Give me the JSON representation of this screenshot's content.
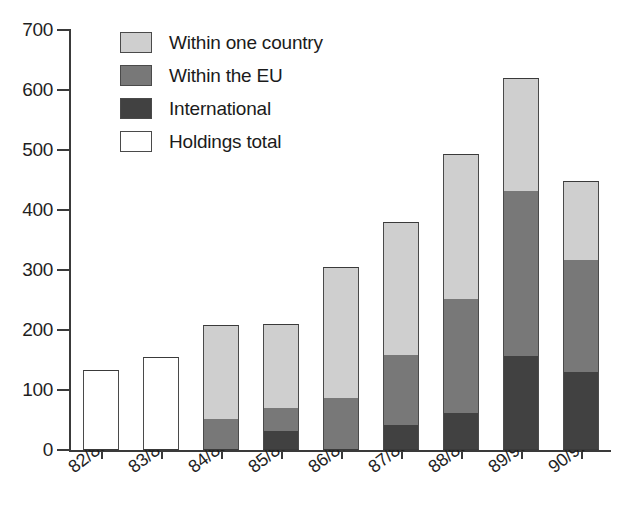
{
  "chart_data": {
    "type": "bar",
    "subtype": "stacked-bar",
    "title": "",
    "xlabel": "",
    "ylabel": "",
    "ylim": [
      0,
      700
    ],
    "yticks": [
      0,
      100,
      200,
      300,
      400,
      500,
      600,
      700
    ],
    "ytick_labels": [
      "0",
      "100",
      "200",
      "300",
      "400",
      "500",
      "600",
      "700"
    ],
    "grid": false,
    "legend_position": "top-left",
    "categories": [
      "82/83",
      "83/84",
      "84/85",
      "85/86",
      "86/87",
      "87/88",
      "88/89",
      "89/90",
      "90/91"
    ],
    "series": [
      {
        "name": "Within one country",
        "color": "#cfcfcf",
        "values": [
          null,
          null,
          156,
          140,
          218,
          222,
          242,
          189,
          131
        ]
      },
      {
        "name": "Within the EU",
        "color": "#787878",
        "values": [
          null,
          null,
          52,
          38,
          87,
          116,
          190,
          275,
          187
        ]
      },
      {
        "name": "International",
        "color": "#414141",
        "values": [
          null,
          null,
          0,
          32,
          0,
          42,
          61,
          156,
          130
        ]
      },
      {
        "name": "Holdings total",
        "color": "#ffffff",
        "values": [
          133,
          155,
          null,
          null,
          null,
          null,
          null,
          null,
          null
        ]
      }
    ],
    "totals": [
      133,
      155,
      208,
      210,
      305,
      380,
      493,
      620,
      448
    ],
    "annotations": []
  },
  "legend": {
    "items": [
      {
        "label": "Within one country",
        "swatch": "light-gray",
        "color": "#cfcfcf"
      },
      {
        "label": "Within the EU",
        "swatch": "medium-gray",
        "color": "#787878"
      },
      {
        "label": "International",
        "swatch": "dark-gray",
        "color": "#414141"
      },
      {
        "label": "Holdings total",
        "swatch": "white",
        "color": "#ffffff"
      }
    ]
  }
}
